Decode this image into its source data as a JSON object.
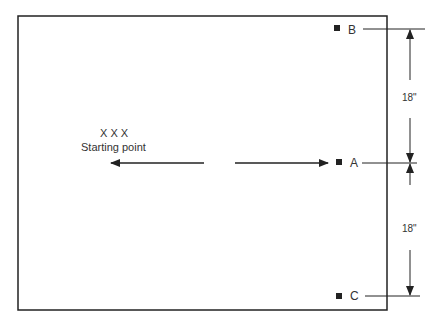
{
  "diagram": {
    "points": [
      {
        "id": "B",
        "label": "B"
      },
      {
        "id": "A",
        "label": "A"
      },
      {
        "id": "C",
        "label": "C"
      }
    ],
    "start": {
      "marks": "X X X",
      "label": "Starting point"
    },
    "dimensions": [
      {
        "label": "18\"",
        "between": [
          "B",
          "A"
        ]
      },
      {
        "label": "18\"",
        "between": [
          "A",
          "C"
        ]
      }
    ],
    "colors": {
      "line": "#222222",
      "background": "#ffffff"
    }
  }
}
